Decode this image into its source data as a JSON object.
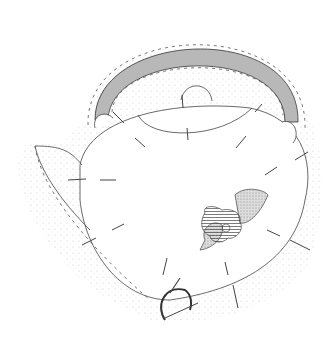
{
  "illustration": {
    "subject": "Sewing pattern drawing of a teapot with handle, lid, spout, pins and flower appliqué",
    "colors": {
      "line": "#333333",
      "stipple": "#bdbdbd",
      "handle_fill": "#b5b5b5",
      "background": "#ffffff"
    },
    "elements": [
      "handle",
      "lid",
      "lid-knob",
      "body",
      "spout",
      "flower-applique",
      "leaf-left",
      "leaf-right",
      "pins",
      "scissors",
      "stitching-dashes"
    ]
  }
}
